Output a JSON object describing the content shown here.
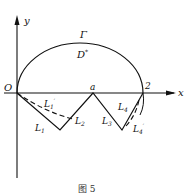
{
  "figure": {
    "caption": "图 5",
    "labels": {
      "y_axis": "y",
      "x_axis": "x",
      "origin": "O",
      "point_a": "a",
      "point_2": "2",
      "curve": "Γ",
      "region": "D",
      "region_sup": "*",
      "L1": "L",
      "L1_sub": "1",
      "L2": "L",
      "L2_sub": "2",
      "L3": "L",
      "L3_sub": "3",
      "L4": "L",
      "L4_sub": "4",
      "L1p": "L",
      "L1p_sub": "1",
      "L1p_prime": "′",
      "L4p": "L",
      "L4p_sub": "4",
      "L4p_prime": "′"
    }
  }
}
